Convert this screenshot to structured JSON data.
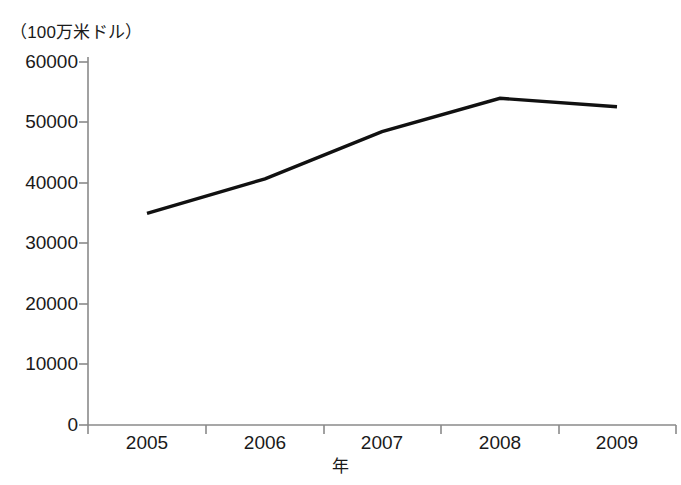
{
  "chart_data": {
    "type": "line",
    "title": "",
    "subtitle": "",
    "unit_note": "（100万米ドル）",
    "xlabel": "年",
    "ylabel": "",
    "categories": [
      "2005",
      "2006",
      "2007",
      "2008",
      "2009"
    ],
    "x": [
      2005,
      2006,
      2007,
      2008,
      2009
    ],
    "values": [
      35000,
      40700,
      48500,
      54000,
      52600
    ],
    "series": [
      {
        "name": "",
        "values": [
          35000,
          40700,
          48500,
          54000,
          52600
        ],
        "color": "#111111"
      }
    ],
    "ylim": [
      0,
      60000
    ],
    "yticks": [
      0,
      10000,
      20000,
      30000,
      40000,
      50000,
      60000
    ],
    "ytick_labels": [
      "0",
      "10000",
      "20000",
      "30000",
      "40000",
      "50000",
      "60000"
    ],
    "xtick_labels": [
      "2005",
      "2006",
      "2007",
      "2008",
      "2009"
    ],
    "grid": false,
    "legend": false,
    "legend_position": "none",
    "line_color": "#111111",
    "axis_color": "#8a8a8a",
    "background": "#ffffff"
  },
  "axis": {
    "y_unit_caption": "（100万米ドル）",
    "x_title": "年"
  }
}
